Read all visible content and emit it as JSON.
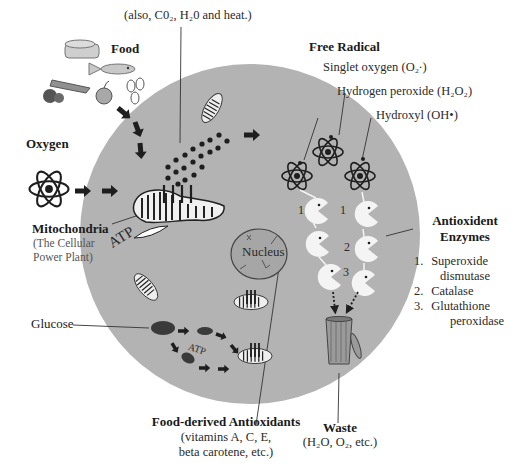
{
  "colors": {
    "cell": "#b3b3b3",
    "ink": "#1e1e1e",
    "nucleus": "#a6a6a6",
    "food_light": "#c8c8c8",
    "food_dark": "#555555"
  },
  "labels": {
    "byproducts": "(also, C0₂, H₂0 and heat.)",
    "food": "Food",
    "oxygen": "Oxygen",
    "mitochondria_title": "Mitochondria",
    "mitochondria_sub1": "(The Cellular",
    "mitochondria_sub2": "Power Plant)",
    "atp_main": "ATP",
    "atp_small": "ATP",
    "nucleus": "Nucleus",
    "glucose": "Glucose",
    "free_radical": "Free Radical",
    "singlet_oxygen": "Singlet oxygen (O₂·)",
    "hydrogen_peroxide": "Hydrogen peroxide (H₂O₂)",
    "hydroxyl": "Hydroxyl (OH•)",
    "enzymes_title1": "Antioxident",
    "enzymes_title2": "Enzymes",
    "enzyme_list": [
      {
        "num": "1.",
        "name": "Superoxide",
        "cont": "dismutase"
      },
      {
        "num": "2.",
        "name": "Catalase",
        "cont": ""
      },
      {
        "num": "3.",
        "name": "Glutathione",
        "cont": "peroxidase"
      }
    ],
    "food_antioxidants_title": "Food-derived Antioxidants",
    "food_antioxidants_sub1": "(vitamins A, C, E,",
    "food_antioxidants_sub2": "beta carotene, etc.)",
    "waste_title": "Waste",
    "waste_sub": "(H₂O, O₂, etc.)",
    "pacman_numbers": [
      "1",
      "1",
      "2",
      "3"
    ]
  }
}
